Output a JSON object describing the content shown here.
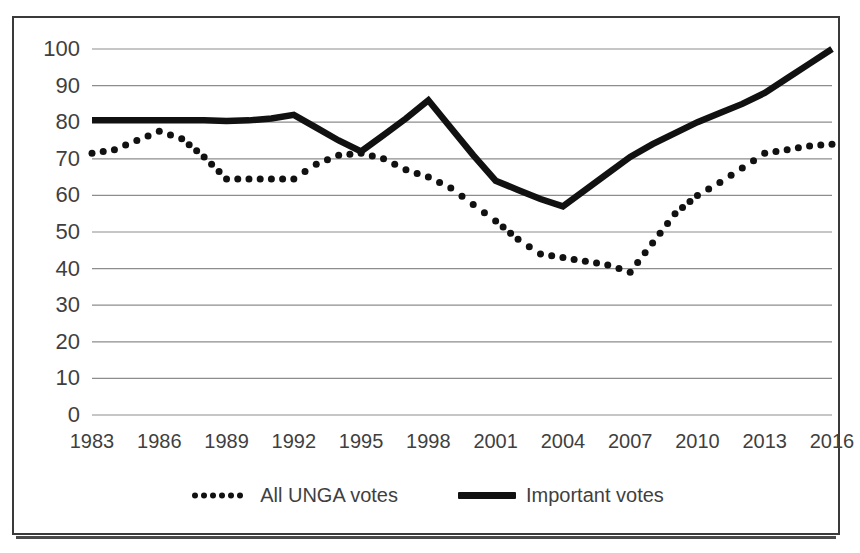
{
  "chart_data": {
    "type": "line",
    "title": "",
    "subtitle": "",
    "xlabel": "",
    "ylabel": "",
    "xlim": [
      1983,
      2016
    ],
    "ylim": [
      0,
      100
    ],
    "grid": true,
    "legend_position": "bottom-center",
    "x": [
      1983,
      1984,
      1985,
      1986,
      1987,
      1988,
      1989,
      1990,
      1991,
      1992,
      1993,
      1994,
      1995,
      1996,
      1997,
      1998,
      1999,
      2000,
      2001,
      2002,
      2003,
      2004,
      2005,
      2006,
      2007,
      2008,
      2009,
      2010,
      2011,
      2012,
      2013,
      2014,
      2015,
      2016
    ],
    "xtick_labels": [
      "1983",
      "1986",
      "1989",
      "1992",
      "1995",
      "1998",
      "2001",
      "2004",
      "2007",
      "2010",
      "2013",
      "2016"
    ],
    "xticks": [
      1983,
      1986,
      1989,
      1992,
      1995,
      1998,
      2001,
      2004,
      2007,
      2010,
      2013,
      2016
    ],
    "ytick_labels": [
      "0",
      "10",
      "20",
      "30",
      "40",
      "50",
      "60",
      "70",
      "80",
      "90",
      "100"
    ],
    "yticks": [
      0,
      10,
      20,
      30,
      40,
      50,
      60,
      70,
      80,
      90,
      100
    ],
    "series": [
      {
        "name": "All UNGA votes",
        "style": "dotted",
        "color": "#111111",
        "values": [
          71.5,
          72.5,
          75.0,
          77.5,
          75.5,
          70.5,
          64.5,
          64.5,
          64.5,
          64.5,
          68.5,
          71.0,
          71.5,
          70.0,
          67.0,
          65.0,
          62.0,
          57.5,
          53.0,
          48.0,
          44.0,
          43.0,
          42.0,
          41.0,
          39.0,
          47.0,
          55.0,
          60.0,
          63.5,
          67.5,
          71.5,
          72.5,
          73.5,
          74.0
        ]
      },
      {
        "name": "Important votes",
        "style": "solid",
        "color": "#111111",
        "values": [
          80.5,
          80.5,
          80.5,
          80.5,
          80.5,
          80.5,
          80.3,
          80.5,
          81.0,
          82.0,
          78.5,
          75.0,
          72.0,
          76.5,
          81.0,
          86.0,
          78.5,
          71.0,
          64.0,
          61.5,
          59.0,
          57.0,
          61.5,
          66.0,
          70.5,
          74.0,
          77.0,
          80.0,
          82.5,
          85.0,
          88.0,
          92.0,
          96.0,
          100.0
        ]
      }
    ]
  },
  "legend": {
    "entries": [
      {
        "label": "All UNGA votes",
        "marker": "dotted-line-swatch"
      },
      {
        "label": "Important votes",
        "marker": "solid-line-swatch"
      }
    ]
  }
}
